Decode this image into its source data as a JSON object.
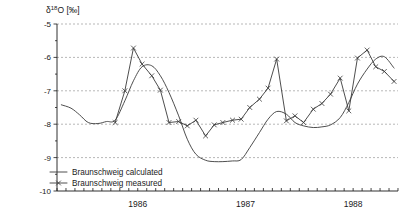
{
  "chart_data": {
    "type": "line",
    "title": "",
    "ylabel": "δ¹⁸O [‰]",
    "ylabel_base": "δ",
    "ylabel_sup": "18",
    "ylabel_rest": "O [‰]",
    "xlabel": "",
    "ylim": [
      -10,
      -5
    ],
    "yticks": [
      -5,
      -6,
      -7,
      -8,
      -9,
      -10
    ],
    "ytick_labels": [
      "-5",
      "-6",
      "-7",
      "-8",
      "-9",
      "-10"
    ],
    "xlim": [
      1985.75,
      1988.9167
    ],
    "xtick_labels": [
      "1986",
      "1987",
      "1988"
    ],
    "xtick_positions": [
      1986.5,
      1987.5,
      1988.5
    ],
    "x_minor_tick_step_months": 1,
    "grid": true,
    "legend_position": "bottom-left",
    "series": [
      {
        "name": "Braunschweig calculated",
        "marker": "none",
        "line": "solid",
        "x": [
          1985.79,
          1985.88,
          1985.96,
          1986.04,
          1986.13,
          1986.21,
          1986.29,
          1986.38,
          1986.46,
          1986.54,
          1986.63,
          1986.71,
          1986.79,
          1986.88,
          1986.96,
          1987.04,
          1987.13,
          1987.21,
          1987.29,
          1987.38,
          1987.46,
          1987.54,
          1987.63,
          1987.71,
          1987.79,
          1987.88,
          1987.96,
          1988.04,
          1988.13,
          1988.21,
          1988.29,
          1988.38,
          1988.46,
          1988.54,
          1988.63,
          1988.71,
          1988.79,
          1988.88
        ],
        "y": [
          -7.42,
          -7.52,
          -7.72,
          -7.95,
          -7.98,
          -7.92,
          -7.88,
          -7.3,
          -6.7,
          -6.28,
          -6.25,
          -6.55,
          -7.05,
          -7.75,
          -8.45,
          -8.9,
          -9.08,
          -9.12,
          -9.12,
          -9.1,
          -9.06,
          -8.7,
          -8.25,
          -7.85,
          -7.62,
          -7.7,
          -7.95,
          -8.05,
          -8.1,
          -8.08,
          -8.02,
          -7.8,
          -7.35,
          -6.8,
          -6.35,
          -6.05,
          -5.98,
          -6.32
        ]
      },
      {
        "name": "Braunschweig measured",
        "marker": "x",
        "line": "solid",
        "x": [
          1986.29,
          1986.38,
          1986.46,
          1986.54,
          1986.63,
          1986.71,
          1986.79,
          1986.88,
          1986.96,
          1987.04,
          1987.13,
          1987.21,
          1987.29,
          1987.38,
          1987.46,
          1987.54,
          1987.63,
          1987.71,
          1987.79,
          1987.88,
          1987.96,
          1988.04,
          1988.13,
          1988.21,
          1988.29,
          1988.38,
          1988.46,
          1988.54,
          1988.63,
          1988.71,
          1988.79,
          1988.88
        ],
        "y": [
          -7.95,
          -7.0,
          -5.72,
          -6.2,
          -6.55,
          -6.98,
          -7.95,
          -7.92,
          -8.05,
          -7.88,
          -8.35,
          -8.02,
          -7.95,
          -7.88,
          -7.85,
          -7.5,
          -7.25,
          -6.92,
          -6.05,
          -7.9,
          -7.75,
          -7.95,
          -7.55,
          -7.38,
          -7.1,
          -6.62,
          -7.6,
          -6.02,
          -5.78,
          -6.28,
          -6.42,
          -6.72
        ]
      }
    ],
    "legend": [
      {
        "label": "Braunschweig calculated",
        "marker": "none"
      },
      {
        "label": "Braunschweig measured",
        "marker": "x"
      }
    ]
  },
  "colors": {
    "line": "#3a3a3a",
    "grid": "#9a9a9a",
    "axis": "#1a1a1a",
    "background": "#ffffff"
  }
}
